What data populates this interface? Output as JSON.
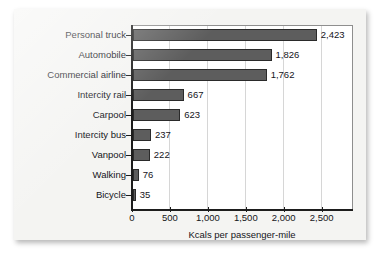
{
  "chart_data": {
    "type": "bar",
    "orientation": "horizontal",
    "title": "",
    "xlabel": "Kcals per passenger-mile",
    "ylabel": "",
    "xlim": [
      0,
      2900
    ],
    "xticks": [
      0,
      500,
      1000,
      1500,
      2000,
      2500
    ],
    "xticklabels": [
      "0",
      "500",
      "1,000",
      "1,500",
      "2,000",
      "2,500"
    ],
    "grid": "vertical",
    "legend": "none",
    "bar_color": "#5d5d5d",
    "bar_edge_color": "#2a2a2a",
    "categories": [
      "Personal truck",
      "Automobile",
      "Commercial airline",
      "Intercity rail",
      "Carpool",
      "Intercity bus",
      "Vanpool",
      "Walking",
      "Bicycle"
    ],
    "values": [
      2423,
      1826,
      1762,
      667,
      623,
      237,
      222,
      76,
      35
    ],
    "value_labels": [
      "2,423",
      "1,826",
      "1,762",
      "667",
      "623",
      "237",
      "222",
      "76",
      "35"
    ]
  }
}
